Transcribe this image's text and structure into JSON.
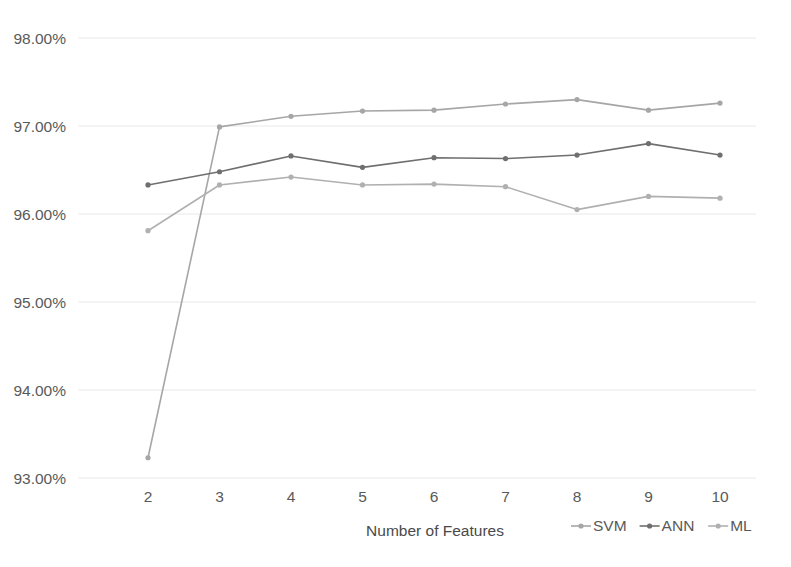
{
  "chart_data": {
    "type": "line",
    "title": "",
    "xlabel": "Number of Features",
    "ylabel": "",
    "x": [
      2,
      3,
      4,
      5,
      6,
      7,
      8,
      9,
      10
    ],
    "xtick_labels": [
      "2",
      "3",
      "4",
      "5",
      "6",
      "7",
      "8",
      "9",
      "10"
    ],
    "ytick_labels": [
      "98.00%",
      "97.00%",
      "96.00%",
      "95.00%",
      "94.00%",
      "93.00%"
    ],
    "ytick_values": [
      98.0,
      97.0,
      96.0,
      95.0,
      94.0,
      93.0
    ],
    "ylim": [
      92.6,
      98.0
    ],
    "xlim": [
      1.6,
      10.55
    ],
    "grid": true,
    "grid_axis": "y",
    "legend_position": "bottom-right",
    "series": [
      {
        "name": "SVM",
        "color": "#a6a6a6",
        "values": [
          93.23,
          96.99,
          97.11,
          97.17,
          97.18,
          97.25,
          97.3,
          97.18,
          97.26
        ]
      },
      {
        "name": "ANN",
        "color": "#6f6f6f",
        "values": [
          96.33,
          96.48,
          96.66,
          96.53,
          96.64,
          96.63,
          96.67,
          96.8,
          96.67
        ]
      },
      {
        "name": "ML",
        "color": "#b0b0b0",
        "values": [
          95.81,
          96.33,
          96.42,
          96.33,
          96.34,
          96.31,
          96.05,
          96.2,
          96.18
        ]
      }
    ]
  },
  "legend": {
    "items": [
      {
        "label": "SVM",
        "color": "#a6a6a6"
      },
      {
        "label": "ANN",
        "color": "#6f6f6f"
      },
      {
        "label": "ML",
        "color": "#b0b0b0"
      }
    ]
  },
  "axis": {
    "x_title": "Number of Features"
  }
}
